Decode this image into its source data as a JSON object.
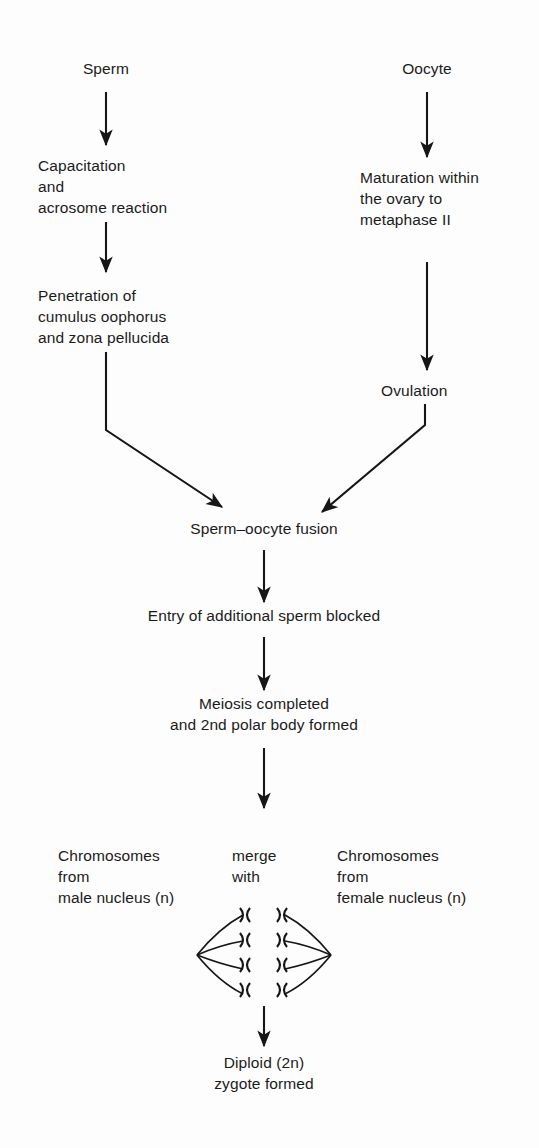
{
  "diagram": {
    "line_color": "#161616",
    "text_color": "#1b1b1b",
    "background": "#fdfdfd",
    "nodes": {
      "sperm": "Sperm",
      "oocyte": "Oocyte",
      "capacitation": "Capacitation\nand\nacrosome reaction",
      "maturation": "Maturation within\nthe ovary to\nmetaphase II",
      "penetration": "Penetration of\ncumulus oophorus\nand zona pellucida",
      "ovulation": "Ovulation",
      "fusion": "Sperm–oocyte fusion",
      "block": "Entry of additional sperm blocked",
      "meiosis": "Meiosis completed\nand 2nd polar body formed",
      "male_chromosomes": "Chromosomes\nfrom\nmale nucleus (n)",
      "merge_with": "merge\nwith",
      "female_chromosomes": "Chromosomes\nfrom\nfemale nucleus (n)",
      "zygote": "Diploid (2n)\nzygote formed"
    },
    "arrows": [
      {
        "name": "sperm-to-capacitation",
        "from": "sperm",
        "to": "capacitation"
      },
      {
        "name": "oocyte-to-maturation",
        "from": "oocyte",
        "to": "maturation"
      },
      {
        "name": "capacitation-to-penetration",
        "from": "capacitation",
        "to": "penetration"
      },
      {
        "name": "maturation-to-ovulation",
        "from": "maturation",
        "to": "ovulation"
      },
      {
        "name": "penetration-to-fusion",
        "from": "penetration",
        "to": "fusion"
      },
      {
        "name": "ovulation-to-fusion",
        "from": "ovulation",
        "to": "fusion"
      },
      {
        "name": "fusion-to-block",
        "from": "fusion",
        "to": "block"
      },
      {
        "name": "block-to-meiosis",
        "from": "block",
        "to": "meiosis"
      },
      {
        "name": "meiosis-to-chromosomes",
        "from": "meiosis",
        "to": "chromosome-merge"
      },
      {
        "name": "chromosomes-to-zygote",
        "from": "chromosome-merge",
        "to": "zygote"
      }
    ],
    "spindle": {
      "name": "chromosome-spindle-figure",
      "left_pole": [
        197,
        955
      ],
      "right_pole": [
        331,
        955
      ],
      "male_column_x": 245,
      "female_column_x": 282,
      "chromosome_count_per_column": 4,
      "chromosome_y": [
        918,
        943,
        967,
        991
      ]
    }
  }
}
